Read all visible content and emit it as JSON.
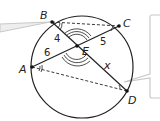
{
  "diagram": {
    "type": "circle-intersecting-chords",
    "points": {
      "A": {
        "label": "A"
      },
      "B": {
        "label": "B"
      },
      "C": {
        "label": "C"
      },
      "D": {
        "label": "D"
      },
      "E": {
        "label": "E"
      }
    },
    "segments": {
      "BE": "4",
      "AE": "6",
      "CE": "5",
      "ED": "x"
    },
    "chords": [
      "BD",
      "AC"
    ],
    "dashed_segments": [
      "BC",
      "AD"
    ],
    "angle_marks": [
      "angle B (double arc)",
      "angle A (double arc)",
      "vertical angles at E (triple arcs)"
    ],
    "colors": {
      "stroke": "#222222",
      "callout": "#c8c8c8"
    }
  }
}
